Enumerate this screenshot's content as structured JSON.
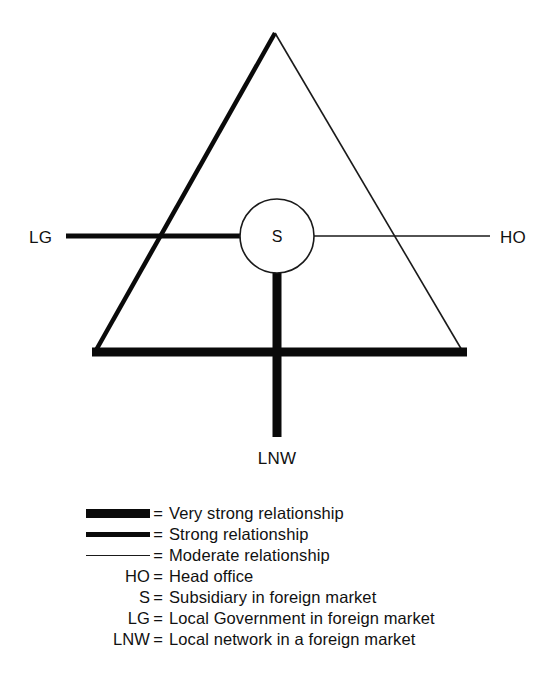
{
  "diagram": {
    "title": "",
    "nodes": [
      {
        "id": "LG",
        "label": "LG",
        "x": 42,
        "y": 236
      },
      {
        "id": "HO",
        "label": "HO",
        "x": 514,
        "y": 236
      },
      {
        "id": "S",
        "label": "S",
        "x": 277,
        "y": 236
      },
      {
        "id": "LNW",
        "label": "LNW",
        "x": 277,
        "y": 456
      }
    ],
    "relationships": [
      {
        "from": "LG",
        "to": "S",
        "strength": "strong"
      },
      {
        "from": "S",
        "to": "HO",
        "strength": "moderate"
      },
      {
        "from": "S",
        "to": "LNW",
        "strength": "very-strong"
      },
      {
        "from": "triangle-left-edge",
        "strength": "strong"
      },
      {
        "from": "triangle-right-edge",
        "strength": "moderate"
      },
      {
        "from": "triangle-bottom-edge",
        "strength": "very-strong"
      }
    ],
    "geometry": {
      "apex": {
        "x": 275,
        "y": 33
      },
      "bottom_left": {
        "x": 95,
        "y": 352
      },
      "bottom_right": {
        "x": 463,
        "y": 352
      },
      "circle": {
        "cx": 277,
        "cy": 236,
        "r": 37
      }
    },
    "stroke_widths": {
      "very_strong": 9,
      "strong": 5,
      "moderate": 1.5
    },
    "colors": {
      "ink": "#0a0a0a",
      "thin_ink": "#1a1a1a",
      "background": "#ffffff"
    }
  },
  "legend": {
    "rows": [
      {
        "key": "swatch-very-strong",
        "key_type": "swatch",
        "eq": "=",
        "description": "Very strong relationship"
      },
      {
        "key": "swatch-strong",
        "key_type": "swatch",
        "eq": "=",
        "description": "Strong relationship"
      },
      {
        "key": "swatch-moderate",
        "key_type": "swatch",
        "eq": "=",
        "description": "Moderate relationship"
      },
      {
        "key": "HO",
        "key_type": "text",
        "eq": "=",
        "description": "Head office"
      },
      {
        "key": "S",
        "key_type": "text",
        "eq": "=",
        "description": "Subsidiary in foreign market"
      },
      {
        "key": "LG",
        "key_type": "text",
        "eq": "=",
        "description": "Local Government in foreign market"
      },
      {
        "key": "LNW",
        "key_type": "text",
        "eq": "=",
        "description": "Local network in a foreign market"
      }
    ]
  }
}
